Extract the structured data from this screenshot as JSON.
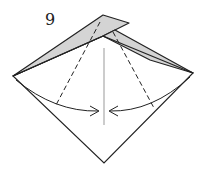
{
  "diagram": {
    "step_number": "9",
    "colors": {
      "paper_back": "#d4d4d4",
      "paper_front": "#ffffff",
      "line": "#222222",
      "crease": "#999999"
    }
  }
}
